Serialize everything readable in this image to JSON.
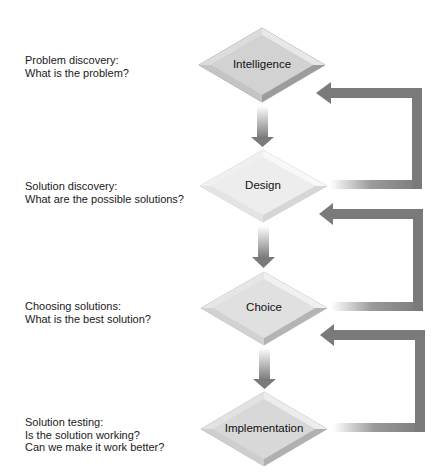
{
  "colors": {
    "arrow": "#7a7a7a",
    "diamond_dark": "#b8b8b8",
    "diamond_light": "#ececec",
    "text": "#1a1a1a"
  },
  "stages": [
    {
      "name": "Intelligence",
      "description": [
        "Problem discovery:",
        "What is the problem?"
      ]
    },
    {
      "name": "Design",
      "description": [
        "Solution discovery:",
        "What are the possible solutions?"
      ]
    },
    {
      "name": "Choice",
      "description": [
        "Choosing solutions:",
        "What is the best solution?"
      ]
    },
    {
      "name": "Implementation",
      "description": [
        "Solution testing:",
        "Is the solution working?",
        "Can we make it work better?"
      ]
    }
  ],
  "flow": {
    "forward": [
      "Intelligence → Design",
      "Design → Choice",
      "Choice → Implementation"
    ],
    "feedback": [
      "Design → Intelligence",
      "Choice → Design",
      "Implementation → Choice"
    ]
  }
}
